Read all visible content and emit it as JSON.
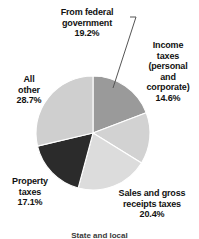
{
  "chart_data": {
    "type": "pie",
    "title": "",
    "subtitle": "",
    "xlabel": "",
    "ylabel": "",
    "legend_position": "labels-around-pie",
    "grid": false,
    "units": "percent",
    "total": 100.0,
    "start_angle_deg": 0,
    "direction": "clockwise",
    "categories": [
      "From federal government",
      "Income taxes (personal and corporate)",
      "Sales and gross receipts taxes",
      "Property taxes",
      "All other"
    ],
    "values": [
      19.2,
      14.6,
      20.4,
      17.1,
      28.7
    ],
    "colors": [
      "#9a9a9a",
      "#d2d2d2",
      "#dcdcdc",
      "#2b2b2b",
      "#cfcfcf"
    ],
    "slices": [
      {
        "name": "From federal government",
        "label": "From federal\ngovernment\n19.2%",
        "value": 19.2,
        "value_text": "19.2%",
        "color": "#9a9a9a",
        "start_deg": 0.0,
        "end_deg": 69.1,
        "has_leader_line": true
      },
      {
        "name": "Income taxes (personal and corporate)",
        "label": "Income\ntaxes\n(personal\nand\ncorporate)\n14.6%",
        "value": 14.6,
        "value_text": "14.6%",
        "color": "#d2d2d2",
        "start_deg": 69.1,
        "end_deg": 121.7,
        "has_leader_line": false
      },
      {
        "name": "Sales and gross receipts taxes",
        "label": "Sales and gross\nreceipts taxes\n20.4%",
        "value": 20.4,
        "value_text": "20.4%",
        "color": "#dcdcdc",
        "start_deg": 121.7,
        "end_deg": 195.1,
        "has_leader_line": false
      },
      {
        "name": "Property taxes",
        "label": "Property\ntaxes\n17.1%",
        "value": 17.1,
        "value_text": "17.1%",
        "color": "#2b2b2b",
        "start_deg": 195.1,
        "end_deg": 256.7,
        "has_leader_line": false
      },
      {
        "name": "All other",
        "label": "All\nother\n28.7%",
        "value": 28.7,
        "value_text": "28.7%",
        "color": "#cfcfcf",
        "start_deg": 256.7,
        "end_deg": 360.0,
        "has_leader_line": false
      }
    ]
  },
  "labels": {
    "federal": "From federal\ngovernment\n19.2%",
    "income": "Income\ntaxes\n(personal\nand\ncorporate)\n14.6%",
    "sales": "Sales and gross\nreceipts taxes\n20.4%",
    "property": "Property\ntaxes\n17.1%",
    "all_other": "All\nother\n28.7%"
  },
  "caption": {
    "text": "State and local"
  },
  "style": {
    "background": "#ffffff",
    "text_color": "#111111",
    "slice_border": "#ffffff",
    "leader_line_color": "#555555"
  }
}
